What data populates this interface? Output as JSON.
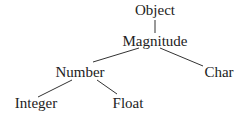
{
  "diagram": {
    "type": "tree",
    "title": "",
    "nodes": [
      {
        "id": "object",
        "label": "Object",
        "x": 155,
        "y": 15
      },
      {
        "id": "magnitude",
        "label": "Magnitude",
        "x": 155,
        "y": 46
      },
      {
        "id": "number",
        "label": "Number",
        "x": 80,
        "y": 77
      },
      {
        "id": "char",
        "label": "Char",
        "x": 219,
        "y": 77
      },
      {
        "id": "integer",
        "label": "Integer",
        "x": 36,
        "y": 108
      },
      {
        "id": "float",
        "label": "Float",
        "x": 128,
        "y": 108
      }
    ],
    "edges": [
      {
        "from": "object",
        "to": "magnitude",
        "x1": 155,
        "y1": 20,
        "x2": 155,
        "y2": 33
      },
      {
        "from": "magnitude",
        "to": "number",
        "x1": 139,
        "y1": 48,
        "x2": 93,
        "y2": 62
      },
      {
        "from": "magnitude",
        "to": "char",
        "x1": 160,
        "y1": 48,
        "x2": 203,
        "y2": 66
      },
      {
        "from": "number",
        "to": "integer",
        "x1": 72,
        "y1": 80,
        "x2": 38,
        "y2": 97
      },
      {
        "from": "number",
        "to": "float",
        "x1": 97,
        "y1": 80,
        "x2": 117,
        "y2": 94
      }
    ],
    "colors": {
      "text": "#222222",
      "line": "#333333",
      "background": "#ffffff"
    }
  }
}
